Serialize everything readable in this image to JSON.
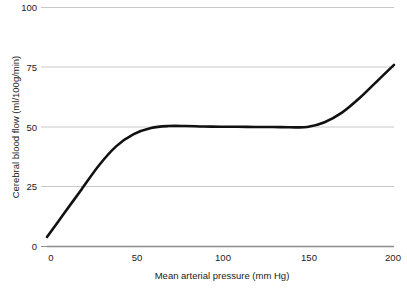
{
  "chart_data": {
    "type": "line",
    "title": "",
    "subtitle": "",
    "xlabel": "Mean arterial pressure (mm Hg)",
    "ylabel": "Cerebral blood flow (ml/100g/min)",
    "xlim": [
      0,
      200
    ],
    "ylim": [
      0,
      100
    ],
    "xticks": [
      0,
      50,
      100,
      150,
      200
    ],
    "yticks": [
      0,
      25,
      50,
      75,
      100
    ],
    "xtick_labels": [
      "0",
      "50",
      "100",
      "150",
      "200"
    ],
    "ytick_labels": [
      "0",
      "25",
      "50",
      "75",
      "100"
    ],
    "grid": true,
    "grid_axis": "y",
    "grid_color": "#c8c8c8",
    "legend": false,
    "legend_position": "none",
    "series": [
      {
        "name": "Cerebral autoregulation curve",
        "color": "#111111",
        "line_width": 2.6,
        "x": [
          0,
          10,
          20,
          30,
          40,
          50,
          60,
          70,
          80,
          90,
          100,
          110,
          120,
          130,
          140,
          150,
          160,
          170,
          180,
          190,
          200
        ],
        "y": [
          4,
          14,
          24,
          34,
          42,
          47,
          49.6,
          50.4,
          50.4,
          50.2,
          50.1,
          50.1,
          50,
          50,
          49.9,
          50,
          52,
          56,
          62,
          69,
          76
        ]
      }
    ],
    "annotations": []
  },
  "axes": {
    "y_axis_label": "Cerebral blood flow (ml/100g/min)",
    "x_axis_label": "Mean arterial pressure (mm Hg)",
    "y_tick_100": "100",
    "y_tick_75": "75",
    "y_tick_50": "50",
    "y_tick_25": "25",
    "y_tick_0": "0",
    "x_tick_0": "0",
    "x_tick_50": "50",
    "x_tick_100": "100",
    "x_tick_150": "150",
    "x_tick_200": "200"
  },
  "colors": {
    "background": "#ffffff",
    "curve": "#111111",
    "gridline": "#c8c8c8",
    "baseline": "#8c8c8c",
    "text": "#1a1a1a"
  }
}
